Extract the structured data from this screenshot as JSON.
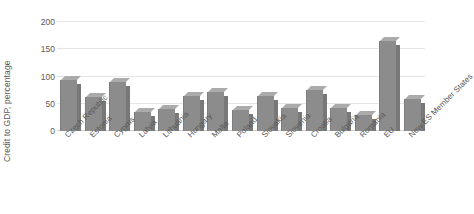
{
  "chart_data": {
    "type": "bar",
    "title": "",
    "xlabel": "",
    "ylabel": "Credit to GDP, percentage",
    "ylim": [
      0,
      200
    ],
    "yticks": [
      0,
      50,
      100,
      150,
      200
    ],
    "ytick_labels": [
      "0",
      "50",
      "100",
      "150",
      "200"
    ],
    "grid": true,
    "legend": "none",
    "orientation": "vertical",
    "bar_color": "#8c8c8c",
    "categories": [
      "Czech Republic",
      "Estonia",
      "Cyprus",
      "Latvia",
      "Lithuania",
      "Hungary",
      "Malta",
      "Poland",
      "Slovakia",
      "Slovenia",
      "Croatia",
      "Bulgaria",
      "Romania",
      "EU",
      "New ES Member States"
    ],
    "values": [
      93,
      62,
      90,
      35,
      40,
      64,
      72,
      38,
      64,
      42,
      75,
      42,
      29,
      165,
      59
    ],
    "series": [
      {
        "name": "Credit to GDP",
        "values": [
          93,
          62,
          90,
          35,
          40,
          64,
          72,
          38,
          64,
          42,
          75,
          42,
          29,
          165,
          59
        ]
      }
    ]
  },
  "colors": {
    "bar_face": "#8c8c8c",
    "bar_top": "#ababab",
    "bar_side": "#787878",
    "gridline": "#e6e6e6",
    "text": "#595959",
    "background": "#ffffff"
  }
}
